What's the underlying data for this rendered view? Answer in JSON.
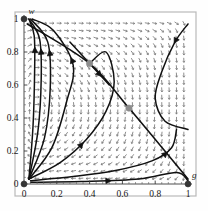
{
  "figure": {
    "kind": "phase-portrait",
    "background": "#fefefe",
    "frame_color": "#b9b9b9"
  },
  "chart_data": {
    "type": "scatter",
    "title": "",
    "subtitle": "",
    "xlabel": "g",
    "ylabel": "w",
    "xlim": [
      0,
      1
    ],
    "ylim": [
      0,
      1
    ],
    "grid": false,
    "legend": null,
    "x_ticks": [
      0,
      0.2,
      0.4,
      0.6,
      0.8,
      1
    ],
    "x_tick_labels": [
      "0",
      "0.2",
      "0.4",
      "0.6",
      "0.8",
      "1"
    ],
    "y_ticks": [
      0,
      0.2,
      0.4,
      0.6,
      0.8,
      1
    ],
    "y_tick_labels": [
      "0",
      "0.2",
      "0.4",
      "0.6",
      "0.8",
      "1"
    ],
    "equilibria": [
      {
        "name": "corner-0-1",
        "x": 0.0,
        "y": 1.0,
        "marker": "filled-circle",
        "color": "#333333"
      },
      {
        "name": "origin-0-0",
        "x": 0.0,
        "y": 0.0,
        "marker": "filled-circle",
        "color": "#333333"
      },
      {
        "name": "corner-1-0",
        "x": 1.0,
        "y": 0.0,
        "marker": "filled-circle",
        "color": "#333333"
      },
      {
        "name": "interior-upper",
        "x": 0.4,
        "y": 0.73,
        "marker": "filled-circle",
        "color": "#8c8c8c"
      },
      {
        "name": "interior-lower",
        "x": 0.64,
        "y": 0.46,
        "marker": "filled-circle",
        "color": "#8c8c8c"
      }
    ],
    "separatrix": {
      "name": "invariant-line",
      "points": [
        [
          0.02,
          0.97
        ],
        [
          0.4,
          0.73
        ],
        [
          0.64,
          0.46
        ],
        [
          1.0,
          0.03
        ]
      ],
      "color": "#111111"
    },
    "vector_field": {
      "style": "dashes-with-arrowheads",
      "color": "#7a7a7a",
      "nx": 22,
      "ny": 22,
      "description": "flow dashes; near-vertical downward at left edge, down-left diagonal in interior, left-pointing near bottom-right"
    },
    "trajectories": [
      {
        "name": "traj-left-1",
        "points": [
          [
            0.03,
            0.03
          ],
          [
            0.055,
            0.35
          ],
          [
            0.065,
            0.7
          ],
          [
            0.062,
            0.9
          ],
          [
            0.03,
            1.0
          ]
        ],
        "arrow_at": 0.82,
        "arrow_dir": "up"
      },
      {
        "name": "traj-left-2",
        "points": [
          [
            0.03,
            0.03
          ],
          [
            0.085,
            0.32
          ],
          [
            0.105,
            0.64
          ],
          [
            0.095,
            0.88
          ],
          [
            0.03,
            1.0
          ]
        ],
        "arrow_at": 0.8,
        "arrow_dir": "up"
      },
      {
        "name": "traj-left-3",
        "points": [
          [
            0.03,
            0.03
          ],
          [
            0.125,
            0.28
          ],
          [
            0.16,
            0.58
          ],
          [
            0.145,
            0.86
          ],
          [
            0.04,
            1.0
          ]
        ],
        "arrow_at": 0.78,
        "arrow_dir": "up"
      },
      {
        "name": "traj-left-4",
        "points": [
          [
            0.03,
            0.03
          ],
          [
            0.17,
            0.22
          ],
          [
            0.26,
            0.5
          ],
          [
            0.3,
            0.72
          ],
          [
            0.18,
            0.93
          ],
          [
            0.05,
            1.0
          ]
        ],
        "arrow_at": 0.7,
        "arrow_dir": "up"
      },
      {
        "name": "traj-mid",
        "points": [
          [
            0.03,
            0.03
          ],
          [
            0.22,
            0.13
          ],
          [
            0.38,
            0.27
          ],
          [
            0.5,
            0.44
          ],
          [
            0.55,
            0.62
          ],
          [
            0.5,
            0.8
          ],
          [
            0.4,
            0.73
          ]
        ],
        "arrow_at": 0.35,
        "arrow_dir": "up-right"
      },
      {
        "name": "traj-lower",
        "points": [
          [
            0.04,
            0.02
          ],
          [
            0.3,
            0.045
          ],
          [
            0.55,
            0.08
          ],
          [
            0.78,
            0.14
          ],
          [
            0.9,
            0.22
          ],
          [
            0.93,
            0.33
          ]
        ],
        "arrow_at": 0.85,
        "arrow_dir": "up"
      },
      {
        "name": "traj-bottom",
        "points": [
          [
            0.04,
            0.01
          ],
          [
            0.35,
            0.015
          ],
          [
            0.7,
            0.03
          ],
          [
            0.93,
            0.07
          ],
          [
            1.0,
            0.02
          ]
        ],
        "arrow_at": 0.5,
        "arrow_dir": "right"
      },
      {
        "name": "traj-upper-right",
        "points": [
          [
            1.0,
            0.97
          ],
          [
            0.92,
            0.86
          ],
          [
            0.84,
            0.68
          ],
          [
            0.8,
            0.52
          ],
          [
            0.86,
            0.38
          ],
          [
            1.0,
            0.33
          ]
        ],
        "arrow_at": 0.18,
        "arrow_dir": "down-left"
      },
      {
        "name": "traj-incoming-sep-upper",
        "points": [
          [
            0.28,
            0.86
          ],
          [
            0.4,
            0.73
          ],
          [
            0.52,
            0.6
          ]
        ],
        "arrow_at": 0.8,
        "arrow_dir": "down-right"
      }
    ]
  }
}
